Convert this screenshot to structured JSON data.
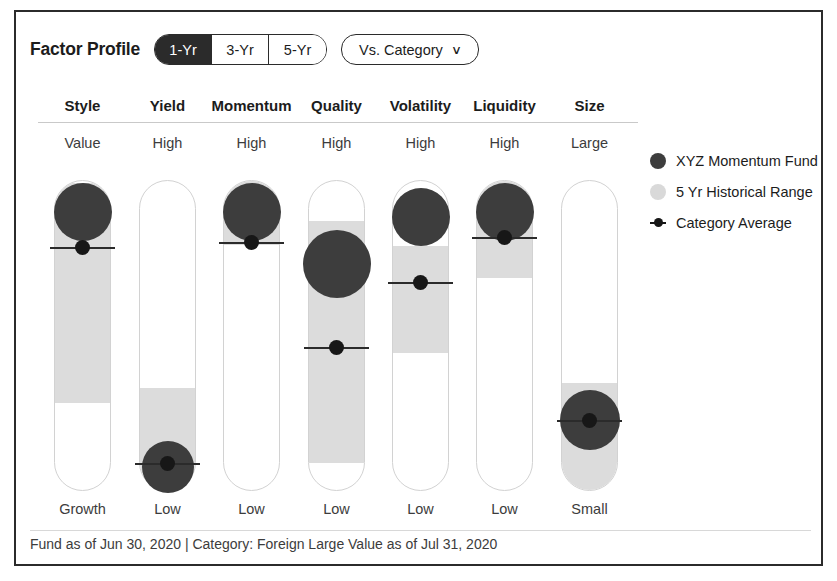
{
  "header": {
    "title": "Factor Profile",
    "period_options": [
      {
        "label": "1-Yr",
        "selected": true
      },
      {
        "label": "3-Yr",
        "selected": false
      },
      {
        "label": "5-Yr",
        "selected": false
      }
    ],
    "comparison": {
      "label": "Vs. Category",
      "caret": "∨"
    }
  },
  "legend": [
    {
      "marker": "dark-circle",
      "label": "XYZ Momentum Fund",
      "color": "#3d3d3d"
    },
    {
      "marker": "light-circle",
      "label": "5 Yr Historical Range",
      "color": "#d9d9d9"
    },
    {
      "marker": "line-dot",
      "label": "Category Average",
      "color": "#171717"
    }
  ],
  "footer": {
    "text": "Fund as of Jun 30, 2020 | Category: Foreign Large Value as of Jul 31, 2020"
  },
  "chart_data": {
    "type": "bar",
    "title": "Factor Profile",
    "xlabel": "",
    "ylabel": "",
    "grid": false,
    "legend_position": "right",
    "axis_note": "Each column is a vertical 0-100 track; 100 = top label, 0 = bottom label",
    "categories": [
      "Style",
      "Yield",
      "Momentum",
      "Quality",
      "Volatility",
      "Liquidity",
      "Size"
    ],
    "top_labels": [
      "Value",
      "High",
      "High",
      "High",
      "High",
      "High",
      "Large"
    ],
    "bottom_labels": [
      "Growth",
      "Low",
      "Low",
      "Low",
      "Low",
      "Low",
      "Small"
    ],
    "series": [
      {
        "name": "XYZ Momentum Fund",
        "values": [
          90,
          6,
          90,
          74,
          89,
          90,
          23
        ]
      },
      {
        "name": "Category Average",
        "values": [
          78,
          9,
          80,
          46,
          67,
          81,
          23
        ]
      },
      {
        "name": "5 Yr Historical Range",
        "ranges": [
          {
            "low": 28,
            "high": 99
          },
          {
            "low": 1,
            "high": 33
          },
          {
            "low": 80,
            "high": 100
          },
          {
            "low": 9,
            "high": 87
          },
          {
            "low": 45,
            "high": 79
          },
          {
            "low": 69,
            "high": 100
          },
          {
            "low": 5,
            "high": 35
          }
        ]
      }
    ]
  },
  "columns": [
    {
      "name": "Style",
      "x": 38,
      "top": "Value",
      "bottom": "Growth",
      "band_top": 170,
      "band_bottom": 390,
      "dot_cy": 200,
      "dot_r": 29,
      "avg_y": 235
    },
    {
      "name": "Yield",
      "x": 123,
      "top": "High",
      "bottom": "Low",
      "band_top": 375,
      "band_bottom": 478,
      "dot_cy": 455,
      "dot_r": 26,
      "avg_y": 451
    },
    {
      "name": "Momentum",
      "x": 207,
      "top": "High",
      "bottom": "Low",
      "band_top": 168,
      "band_bottom": 232,
      "dot_cy": 200,
      "dot_r": 29,
      "avg_y": 230
    },
    {
      "name": "Quality",
      "x": 292,
      "top": "High",
      "bottom": "Low",
      "band_top": 208,
      "band_bottom": 450,
      "dot_cy": 252,
      "dot_r": 34,
      "avg_y": 335
    },
    {
      "name": "Volatility",
      "x": 376,
      "top": "High",
      "bottom": "Low",
      "band_top": 233,
      "band_bottom": 340,
      "dot_cy": 205,
      "dot_r": 29,
      "avg_y": 270
    },
    {
      "name": "Liquidity",
      "x": 460,
      "top": "High",
      "bottom": "Low",
      "band_top": 168,
      "band_bottom": 265,
      "dot_cy": 200,
      "dot_r": 29,
      "avg_y": 225
    },
    {
      "name": "Size",
      "x": 545,
      "top": "Large",
      "bottom": "Small",
      "band_top": 370,
      "band_bottom": 478,
      "dot_cy": 408,
      "dot_r": 30,
      "avg_y": 408
    }
  ]
}
